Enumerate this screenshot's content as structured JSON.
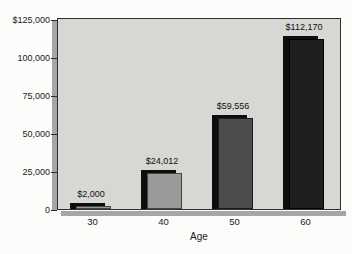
{
  "chart_data": {
    "type": "bar",
    "categories": [
      "30",
      "40",
      "50",
      "60"
    ],
    "values": [
      2000,
      24012,
      59556,
      112170
    ],
    "value_labels": [
      "$2,000",
      "$24,012",
      "$59,556",
      "$112,170"
    ],
    "xlabel": "Age",
    "ylabel": "",
    "ylim": [
      0,
      125000
    ],
    "yticks": [
      125000,
      100000,
      75000,
      50000,
      25000,
      0
    ],
    "ytick_labels": [
      "$125,000",
      "100,000",
      "75,000",
      "50,000",
      "25,000",
      "0"
    ],
    "grid": false,
    "legend_position": "none",
    "colors": {
      "plot_background": "#d7d7d4",
      "plot_border": "#2e2e2e",
      "bar_faces": [
        "#9a9a9a",
        "#9a9a9a",
        "#4d4d4d",
        "#1f1f1f"
      ],
      "bar_borders": [
        "#454545",
        "#454545",
        "#1c1c1c",
        "#000000"
      ],
      "bar_shadow": "#0d0d0d",
      "frame_shadow": "#a6a6a6",
      "page_background": "#fcfcfa"
    }
  }
}
